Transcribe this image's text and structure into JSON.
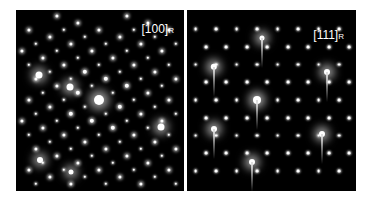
{
  "panels": [
    {
      "id": "left",
      "label_main": "[100]",
      "label_sub": "R",
      "description": "Electron diffraction pattern, square-ish lattice with satellite spots"
    },
    {
      "id": "right",
      "label_main": "[111]",
      "label_sub": "R",
      "description": "Electron diffraction pattern, hexagonal lattice with streaked bright spots"
    }
  ],
  "colors": {
    "background": "#ffffff",
    "panel": "#000000",
    "spot": "#ffffff"
  }
}
